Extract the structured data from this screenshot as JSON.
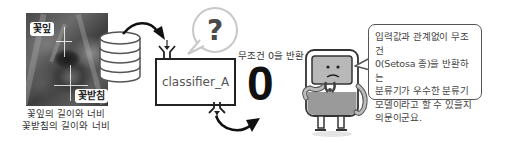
{
  "photo": {
    "label_petal": "꽃잎",
    "label_sepal": "꽃받침",
    "caption_lines": [
      "꽃잎의 길이와 너비",
      "꽃받침의 길이와 너비"
    ]
  },
  "dataset": {
    "icon": "database-icon"
  },
  "classifier": {
    "label": "classifier_A"
  },
  "question_bubble": {
    "symbol": "?"
  },
  "output": {
    "caption": "무조건 0을 반환",
    "value": "0"
  },
  "character": {
    "icon": "confused-robot-icon"
  },
  "speech_bubble": {
    "lines": [
      "입력값과 관계없이 무조건",
      "0(Setosa 종)을 반환하는",
      "분류기가 우수한 분류기",
      "모델이라고 할 수 있을지",
      "의문이군요."
    ]
  },
  "colors": {
    "stroke": "#222222",
    "bubble_gray": "#c8c8c8",
    "robot_body": "#9a9a9a",
    "robot_screen": "#b8b8b8"
  }
}
